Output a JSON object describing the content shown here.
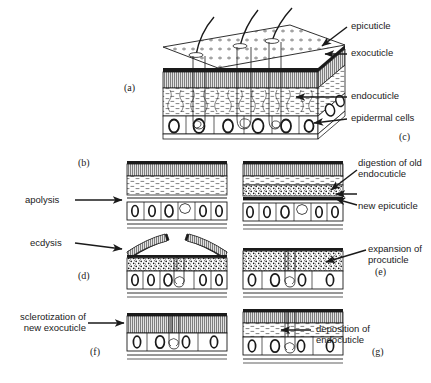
{
  "figure": {
    "ink_color": "#1a1a1a",
    "background": "#ffffff"
  },
  "panel_letters": {
    "a": "(a)",
    "b": "(b)",
    "c": "(c)",
    "d": "(d)",
    "e": "(e)",
    "f": "(f)",
    "g": "(g)"
  },
  "callouts": {
    "epicuticle": "epicuticle",
    "exocuticle": "exocuticle",
    "endocuticle": "endocuticle",
    "epidermal_cells": "epidermal cells",
    "apolysis": "apolysis",
    "ecdysis": "ecdysis",
    "digestion_line1": "digestion of old",
    "digestion_line2": "endocuticle",
    "new_epicuticle": "new epicuticle",
    "expansion_line1": "expansion of",
    "expansion_line2": "procuticle",
    "sclerotization_line1": "sclerotization of",
    "sclerotization_line2": "new exocuticle",
    "deposition_line1": "deposition of",
    "deposition_line2": "endocuticle"
  },
  "layers": {
    "epicuticle": "epicuticle",
    "exocuticle": "exocuticle",
    "endocuticle": "endocuticle",
    "procuticle": "procuticle",
    "epidermis": "epidermal cells",
    "basement_membrane": "basement membrane"
  },
  "sequence": [
    {
      "letter": "(a)",
      "name": "cuticle-block",
      "description": "three-dimensional block of integument with setae"
    },
    {
      "letter": "(b)",
      "name": "apolysis",
      "description": "epidermis separates from old cuticle"
    },
    {
      "letter": "(c)",
      "name": "digestion-and-new-epicuticle",
      "description": "moulting fluid digests old endocuticle; new epicuticle laid down"
    },
    {
      "letter": "(d)",
      "name": "ecdysis",
      "description": "old cuticle splits and is shed"
    },
    {
      "letter": "(e)",
      "name": "expansion-of-procuticle",
      "description": "new procuticle expands"
    },
    {
      "letter": "(f)",
      "name": "sclerotization",
      "description": "new exocuticle hardens and darkens"
    },
    {
      "letter": "(g)",
      "name": "deposition-of-endocuticle",
      "description": "new endocuticle is deposited"
    }
  ]
}
